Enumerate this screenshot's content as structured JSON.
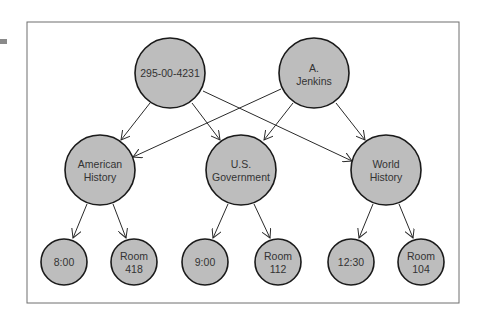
{
  "diagram": {
    "type": "directed-graph",
    "colors": {
      "node_fill": "#bdbdbd",
      "node_stroke": "#1a1a1a",
      "edge": "#2a2a2a",
      "frame": "#6e6e6e",
      "text": "#333333"
    },
    "nodes": [
      {
        "id": "ssn",
        "lines": [
          "295-00-4231"
        ],
        "level": "top"
      },
      {
        "id": "jenkins",
        "lines": [
          "A.",
          "Jenkins"
        ],
        "level": "top"
      },
      {
        "id": "amhist",
        "lines": [
          "American",
          "History"
        ],
        "level": "middle"
      },
      {
        "id": "usgov",
        "lines": [
          "U.S.",
          "Government"
        ],
        "level": "middle"
      },
      {
        "id": "wohist",
        "lines": [
          "World",
          "History"
        ],
        "level": "middle"
      },
      {
        "id": "t800",
        "lines": [
          "8:00"
        ],
        "level": "bottom"
      },
      {
        "id": "r418",
        "lines": [
          "Room",
          "418"
        ],
        "level": "bottom"
      },
      {
        "id": "t900",
        "lines": [
          "9:00"
        ],
        "level": "bottom"
      },
      {
        "id": "r112",
        "lines": [
          "Room",
          "112"
        ],
        "level": "bottom"
      },
      {
        "id": "t1230",
        "lines": [
          "12:30"
        ],
        "level": "bottom"
      },
      {
        "id": "r104",
        "lines": [
          "Room",
          "104"
        ],
        "level": "bottom"
      }
    ],
    "edges": [
      {
        "from": "ssn",
        "to": "amhist"
      },
      {
        "from": "ssn",
        "to": "usgov"
      },
      {
        "from": "ssn",
        "to": "wohist"
      },
      {
        "from": "jenkins",
        "to": "amhist"
      },
      {
        "from": "jenkins",
        "to": "usgov"
      },
      {
        "from": "jenkins",
        "to": "wohist"
      },
      {
        "from": "amhist",
        "to": "t800"
      },
      {
        "from": "amhist",
        "to": "r418"
      },
      {
        "from": "usgov",
        "to": "t900"
      },
      {
        "from": "usgov",
        "to": "r112"
      },
      {
        "from": "wohist",
        "to": "t1230"
      },
      {
        "from": "wohist",
        "to": "r104"
      }
    ]
  },
  "labels": {
    "ssn_1": "295-00-4231",
    "jenkins_1": "A.",
    "jenkins_2": "Jenkins",
    "amhist_1": "American",
    "amhist_2": "History",
    "usgov_1": "U.S.",
    "usgov_2": "Government",
    "wohist_1": "World",
    "wohist_2": "History",
    "t800_1": "8:00",
    "r418_1": "Room",
    "r418_2": "418",
    "t900_1": "9:00",
    "r112_1": "Room",
    "r112_2": "112",
    "t1230_1": "12:30",
    "r104_1": "Room",
    "r104_2": "104"
  }
}
